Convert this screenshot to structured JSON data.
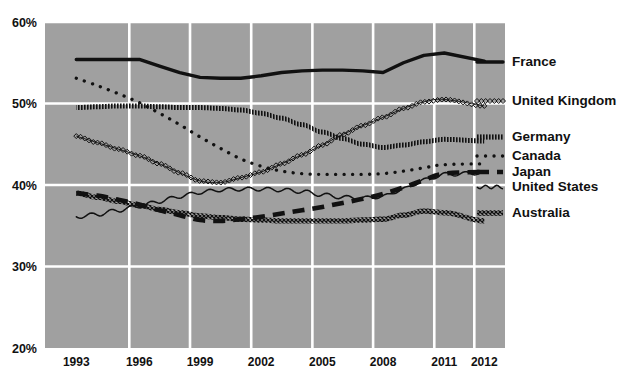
{
  "chart_data": {
    "type": "line",
    "title": "",
    "xlabel": "",
    "ylabel": "",
    "xlim": [
      1993,
      2012
    ],
    "ylim": [
      20,
      60
    ],
    "grid": true,
    "legend_position": "right",
    "yticks": [
      "20%",
      "30%",
      "40%",
      "50%",
      "60%"
    ],
    "ytick_values": [
      20,
      30,
      40,
      50,
      60
    ],
    "xticks": [
      "1993",
      "1996",
      "1999",
      "2002",
      "2005",
      "2008",
      "2011",
      "2012"
    ],
    "xtick_values": [
      1993,
      1996,
      1999,
      2002,
      2005,
      2008,
      2011,
      2012
    ],
    "x": [
      1993,
      1994,
      1995,
      1996,
      1997,
      1998,
      1999,
      2000,
      2001,
      2002,
      2003,
      2004,
      2005,
      2006,
      2007,
      2008,
      2009,
      2010,
      2011,
      2012
    ],
    "series": [
      {
        "name": "France",
        "style": "solid-thick",
        "color": "#111111",
        "values": [
          55.4,
          55.4,
          55.4,
          55.4,
          54.6,
          53.8,
          53.2,
          53.1,
          53.1,
          53.4,
          53.8,
          54.0,
          54.1,
          54.1,
          54.0,
          53.8,
          55.0,
          55.9,
          56.2,
          55.2
        ]
      },
      {
        "name": "United Kingdom",
        "style": "diamond-markers",
        "color": "#111111",
        "values": [
          46.0,
          45.2,
          44.4,
          43.6,
          42.6,
          41.5,
          40.5,
          40.3,
          40.9,
          41.6,
          42.6,
          43.7,
          44.9,
          46.2,
          47.3,
          48.3,
          49.4,
          50.2,
          50.5,
          49.7
        ]
      },
      {
        "name": "Germany",
        "style": "hatched-band",
        "color": "#111111",
        "values": [
          49.5,
          49.6,
          49.7,
          49.7,
          49.6,
          49.5,
          49.5,
          49.4,
          49.2,
          48.8,
          48.2,
          47.4,
          46.5,
          45.7,
          45.0,
          44.6,
          44.9,
          45.3,
          45.6,
          45.4
        ]
      },
      {
        "name": "Canada",
        "style": "dotted",
        "color": "#111111",
        "values": [
          53.1,
          52.2,
          51.2,
          50.1,
          48.8,
          47.4,
          45.9,
          44.5,
          43.2,
          42.3,
          41.7,
          41.4,
          41.3,
          41.3,
          41.3,
          41.4,
          41.7,
          42.1,
          42.5,
          42.6
        ]
      },
      {
        "name": "Japan",
        "style": "dashed-thick",
        "color": "#111111",
        "values": [
          39.0,
          38.7,
          38.2,
          37.6,
          36.9,
          36.3,
          35.7,
          35.6,
          35.8,
          36.1,
          36.5,
          36.9,
          37.3,
          37.8,
          38.3,
          38.9,
          39.7,
          40.6,
          41.4,
          41.6
        ]
      },
      {
        "name": "United States",
        "style": "wavy-thin",
        "color": "#111111",
        "values": [
          36.1,
          36.4,
          36.9,
          37.4,
          38.0,
          38.6,
          39.1,
          39.4,
          39.5,
          39.5,
          39.4,
          39.2,
          38.8,
          38.5,
          38.4,
          38.6,
          39.5,
          40.6,
          41.3,
          41.5
        ]
      },
      {
        "name": "Australia",
        "style": "crosshatch-band",
        "color": "#111111",
        "values": [
          39.0,
          38.5,
          38.0,
          37.5,
          37.0,
          36.6,
          36.2,
          36.0,
          35.8,
          35.7,
          35.6,
          35.6,
          35.6,
          35.6,
          35.7,
          35.8,
          36.3,
          36.8,
          36.6,
          35.6
        ]
      }
    ]
  },
  "plot": {
    "bg_color": "#a0a0a0",
    "grid_color": "#ffffff",
    "left": 45,
    "right": 505,
    "top": 22,
    "bottom": 348
  },
  "legend": {
    "items": [
      {
        "label": "France",
        "y": 62,
        "style": "solid-thick"
      },
      {
        "label": "United Kingdom",
        "y": 101,
        "style": "diamond-markers"
      },
      {
        "label": "Germany",
        "y": 137,
        "style": "hatched-band"
      },
      {
        "label": "Canada",
        "y": 156,
        "style": "dotted"
      },
      {
        "label": "Japan",
        "y": 172,
        "style": "dashed-thick"
      },
      {
        "label": "United States",
        "y": 187,
        "style": "wavy-thin"
      },
      {
        "label": "Australia",
        "y": 213,
        "style": "crosshatch-band"
      }
    ]
  }
}
